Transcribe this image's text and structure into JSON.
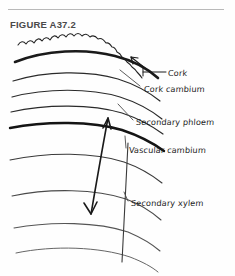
{
  "figure": {
    "title": "FIGURE A37.2",
    "style": "hand-drawn pen diagram",
    "background_color": "#fefefe",
    "ink_color": "#1c1c1c",
    "rule_color": "#b9b9b9",
    "title_color": "#4a4a4a"
  },
  "labels": {
    "cork": "Cork",
    "cork_cambium": "Cork cambium",
    "secondary_phloem": "Secondary phloem",
    "vascular_cambium": "Vascular cambium",
    "secondary_xylem": "Secondary xylem"
  },
  "annotations": {
    "cork_arrow": "short arrow pointing up-left into scalloped cork layer",
    "xylem_extent_arrow": "long double-headed vertical arrow spanning secondary xylem region"
  }
}
